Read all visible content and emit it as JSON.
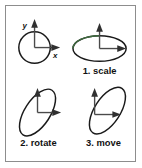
{
  "figure": {
    "border_color": "#8d8d8d",
    "background_color": "#ffffff",
    "stroke_color": "#1a1a1a",
    "axis_color": "#4a4a4a",
    "tint_color": "#3f6b3f"
  },
  "axis_labels": {
    "y": "y",
    "x": "x"
  },
  "panels": [
    {
      "id": "origin",
      "caption": "",
      "shape": "circle",
      "description": "unit circle centred on origin with labelled x and y axes",
      "has_axis_labels": true
    },
    {
      "id": "scale",
      "caption": "1. scale",
      "shape": "ellipse-horizontal",
      "description": "circle scaled into a wide horizontal ellipse",
      "has_axis_labels": false
    },
    {
      "id": "rotate",
      "caption": "2. rotate",
      "shape": "ellipse-rotated",
      "description": "ellipse rotated counter-clockwise about the origin",
      "has_axis_labels": false
    },
    {
      "id": "move",
      "caption": "3. move",
      "shape": "ellipse-translated",
      "description": "rotated ellipse translated along the x axis",
      "has_axis_labels": false
    }
  ]
}
